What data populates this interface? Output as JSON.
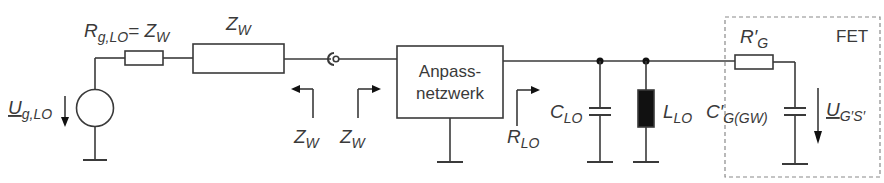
{
  "diagram": {
    "type": "circuit",
    "labels": {
      "source_voltage": "U",
      "source_voltage_sub": "g,LO",
      "source_resistor": "R",
      "source_resistor_sub": "g,LO",
      "source_resistor_eq": "= Z",
      "source_resistor_eq_sub": "W",
      "line": "Z",
      "line_sub": "W",
      "ref_left": "Z",
      "ref_left_sub": "W",
      "ref_right": "Z",
      "ref_right_sub": "W",
      "matching_network_line1": "Anpass-",
      "matching_network_line2": "netzwerk",
      "load_resistance": "R",
      "load_resistance_sub": "LO",
      "capacitor": "C",
      "capacitor_sub": "LO",
      "inductor": "L",
      "inductor_sub": "LO",
      "fet_box": "FET",
      "gate_resistor": "R′",
      "gate_resistor_sub": "G",
      "gate_capacitor": "C′",
      "gate_capacitor_sub": "G(GW)",
      "gate_voltage": "U",
      "gate_voltage_sub": "G′S′"
    },
    "colors": {
      "stroke": "#3a3a3a",
      "inductor_fill": "#111111",
      "fet_border": "#8a8a8a"
    }
  }
}
